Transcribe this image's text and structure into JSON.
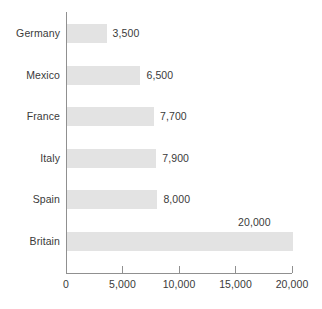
{
  "chart_data": {
    "type": "bar",
    "orientation": "horizontal",
    "title": "",
    "subtitle": "",
    "xlabel": "",
    "ylabel": "",
    "categories": [
      "Germany",
      "Mexico",
      "France",
      "Italy",
      "Spain",
      "Britain"
    ],
    "values": [
      3500,
      6500,
      7700,
      7900,
      8000,
      20000
    ],
    "value_labels": [
      "3,500",
      "6,500",
      "7,700",
      "7,900",
      "8,000",
      "20,000"
    ],
    "series": [
      {
        "name": "",
        "values": [
          3500,
          6500,
          7700,
          7900,
          8000,
          20000
        ]
      }
    ],
    "xlim": [
      0,
      20000
    ],
    "x_ticks": [
      0,
      5000,
      10000,
      15000,
      20000
    ],
    "x_tick_labels": [
      "0",
      "5,000",
      "10,000",
      "15,000",
      "20,000"
    ],
    "grid": false,
    "legend": false,
    "legend_position": "none",
    "bar_color": "#e3e3e3",
    "axis_color": "#909090",
    "text_color": "#3a3a3a",
    "background_color": "#ffffff"
  },
  "bars": [
    {
      "category": "Germany",
      "value": 3500,
      "value_label": "3,500",
      "label_placement": "right-of-bar"
    },
    {
      "category": "Mexico",
      "value": 6500,
      "value_label": "6,500",
      "label_placement": "right-of-bar"
    },
    {
      "category": "France",
      "value": 7700,
      "value_label": "7,700",
      "label_placement": "right-of-bar"
    },
    {
      "category": "Italy",
      "value": 7900,
      "value_label": "7,900",
      "label_placement": "right-of-bar"
    },
    {
      "category": "Spain",
      "value": 8000,
      "value_label": "8,000",
      "label_placement": "right-of-bar"
    },
    {
      "category": "Britain",
      "value": 20000,
      "value_label": "20,000",
      "label_placement": "above-bar-end"
    }
  ],
  "axis": {
    "ticks": [
      {
        "value": 0,
        "label": "0"
      },
      {
        "value": 5000,
        "label": "5,000"
      },
      {
        "value": 10000,
        "label": "10,000"
      },
      {
        "value": 15000,
        "label": "15,000"
      },
      {
        "value": 20000,
        "label": "20,000"
      }
    ]
  }
}
